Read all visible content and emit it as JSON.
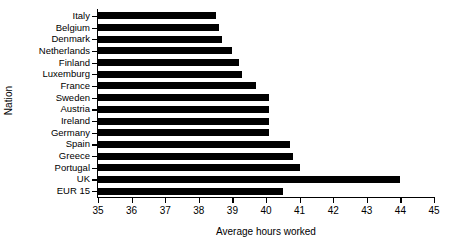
{
  "chart_data": {
    "type": "bar",
    "orientation": "horizontal",
    "title": "",
    "xlabel": "Average hours worked",
    "ylabel": "Nation",
    "xlim": [
      35,
      45
    ],
    "ylim": null,
    "grid": false,
    "legend": null,
    "xticks": [
      35,
      36,
      37,
      38,
      39,
      40,
      41,
      42,
      43,
      44,
      45
    ],
    "xtick_labels": [
      "35",
      "36",
      "37",
      "38",
      "39",
      "40",
      "41",
      "42",
      "43",
      "44",
      "45"
    ],
    "categories": [
      "Italy",
      "Belgium",
      "Denmark",
      "Netherlands",
      "Finland",
      "Luxemburg",
      "France",
      "Sweden",
      "Austria",
      "Ireland",
      "Germany",
      "Spain",
      "Greece",
      "Portugal",
      "UK",
      "EUR 15"
    ],
    "values": [
      38.5,
      38.6,
      38.7,
      39.0,
      39.2,
      39.3,
      39.7,
      40.1,
      40.1,
      40.1,
      40.1,
      40.7,
      40.8,
      41.0,
      44.0,
      40.5
    ],
    "bar_color": "#000000",
    "background_color": "#ffffff"
  }
}
